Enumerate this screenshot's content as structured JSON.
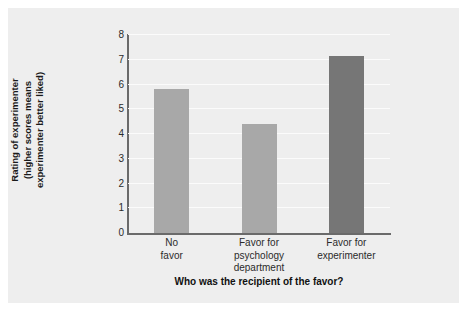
{
  "chart_data": {
    "type": "bar",
    "title": "",
    "subtitle": "",
    "xlabel": "Who was the recipient of the favor?",
    "ylabel": "Rating of experimenter (higher scores means experimenter better liked)",
    "ylabel_lines": [
      "Rating of experimenter",
      "(higher scores means",
      "experimenter better liked)"
    ],
    "categories": [
      "No favor",
      "Favor for psychology department",
      "Favor for experimenter"
    ],
    "category_lines": [
      [
        "No",
        "favor"
      ],
      [
        "Favor for",
        "psychology",
        "department"
      ],
      [
        "Favor for",
        "experimenter"
      ]
    ],
    "values": [
      5.8,
      4.4,
      7.15
    ],
    "bar_colors": [
      "#a8a8a8",
      "#a8a8a8",
      "#767676"
    ],
    "ylim": [
      0,
      8
    ],
    "ytick_labels": [
      "0",
      "1",
      "2",
      "3",
      "4",
      "5",
      "6",
      "7",
      "8"
    ],
    "ytick_values": [
      0,
      1,
      2,
      3,
      4,
      5,
      6,
      7,
      8
    ],
    "grid": true,
    "grid_color": "#fbfbfb",
    "legend": "none",
    "panel_background": "#eeeeee",
    "page_background": "#ffffff",
    "axis_color": "#6a6a6a"
  }
}
